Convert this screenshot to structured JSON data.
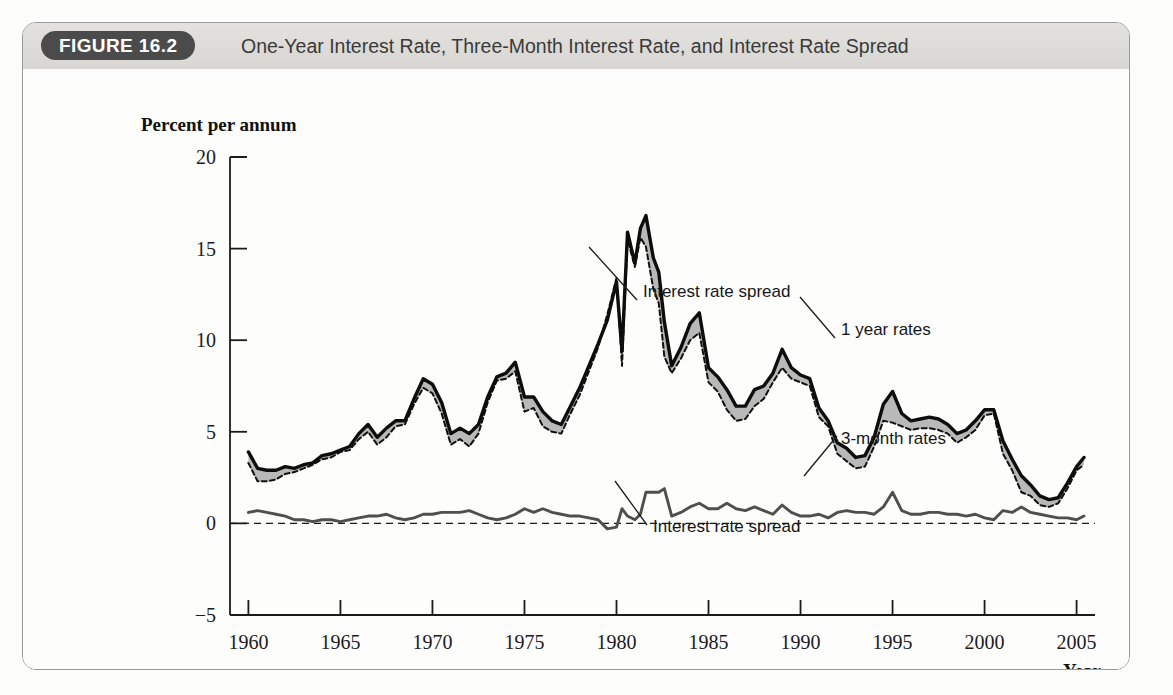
{
  "figure": {
    "badge": "FIGURE 16.2",
    "title": "One-Year Interest Rate, Three-Month Interest Rate, and Interest Rate Spread"
  },
  "chart_data": {
    "type": "line",
    "title": "One-Year Interest Rate, Three-Month Interest Rate, and Interest Rate Spread",
    "xlabel": "Year",
    "ylabel": "Percent per annum",
    "xlim": [
      1959,
      2006
    ],
    "ylim": [
      -5,
      20
    ],
    "yticks": [
      20,
      15,
      10,
      5,
      0,
      -5
    ],
    "xticks": [
      1960,
      1965,
      1970,
      1975,
      1980,
      1985,
      1990,
      1995,
      2000,
      2005
    ],
    "grid": false,
    "legend_position": "inline-annotations",
    "annotations": [
      {
        "text": "Interest rate spread",
        "target": "shaded band between 1-year and 3-month rates",
        "x": 1983.0,
        "y": 12.0
      },
      {
        "text": "1 year rates",
        "target": "solid upper line",
        "x": 1996.5,
        "y": 10.3
      },
      {
        "text": "3-month rates",
        "target": "dashed lower line",
        "x": 1996.8,
        "y": 3.3
      },
      {
        "text": "Interest rate spread",
        "target": "lower solid spread line",
        "x": 1981.5,
        "y": -1.2
      }
    ],
    "series": [
      {
        "name": "1 year rates",
        "style": "solid-thick-black",
        "x": [
          1960.0,
          1960.5,
          1961.0,
          1961.5,
          1962.0,
          1962.5,
          1963.0,
          1963.5,
          1964.0,
          1964.5,
          1965.0,
          1965.5,
          1966.0,
          1966.5,
          1967.0,
          1967.5,
          1968.0,
          1968.5,
          1969.0,
          1969.5,
          1970.0,
          1970.5,
          1971.0,
          1971.5,
          1972.0,
          1972.5,
          1973.0,
          1973.5,
          1974.0,
          1974.5,
          1975.0,
          1975.5,
          1976.0,
          1976.5,
          1977.0,
          1977.5,
          1978.0,
          1978.5,
          1979.0,
          1979.5,
          1980.0,
          1980.3,
          1980.6,
          1981.0,
          1981.3,
          1981.6,
          1982.0,
          1982.3,
          1982.6,
          1983.0,
          1983.5,
          1984.0,
          1984.5,
          1985.0,
          1985.5,
          1986.0,
          1986.5,
          1987.0,
          1987.5,
          1988.0,
          1988.5,
          1989.0,
          1989.5,
          1990.0,
          1990.5,
          1991.0,
          1991.5,
          1992.0,
          1992.5,
          1993.0,
          1993.5,
          1994.0,
          1994.5,
          1995.0,
          1995.5,
          1996.0,
          1996.5,
          1997.0,
          1997.5,
          1998.0,
          1998.5,
          1999.0,
          1999.5,
          2000.0,
          2000.5,
          2001.0,
          2001.5,
          2002.0,
          2002.5,
          2003.0,
          2003.5,
          2004.0,
          2004.5,
          2005.0,
          2005.4
        ],
        "y": [
          3.9,
          3.0,
          2.9,
          2.9,
          3.1,
          3.0,
          3.2,
          3.3,
          3.7,
          3.8,
          4.0,
          4.2,
          4.9,
          5.4,
          4.7,
          5.2,
          5.6,
          5.6,
          6.8,
          7.9,
          7.6,
          6.6,
          4.9,
          5.2,
          4.9,
          5.4,
          6.9,
          8.0,
          8.2,
          8.8,
          6.9,
          6.9,
          6.1,
          5.6,
          5.4,
          6.4,
          7.4,
          8.6,
          9.8,
          11.1,
          13.2,
          9.4,
          15.9,
          14.2,
          16.1,
          16.8,
          14.5,
          13.7,
          11.0,
          8.6,
          9.6,
          10.9,
          11.5,
          8.5,
          8.0,
          7.3,
          6.4,
          6.4,
          7.3,
          7.5,
          8.2,
          9.5,
          8.5,
          8.1,
          7.9,
          6.3,
          5.6,
          4.4,
          4.1,
          3.6,
          3.7,
          4.7,
          6.5,
          7.2,
          6.0,
          5.6,
          5.7,
          5.8,
          5.7,
          5.4,
          4.9,
          5.1,
          5.6,
          6.2,
          6.2,
          4.5,
          3.5,
          2.6,
          2.1,
          1.5,
          1.3,
          1.4,
          2.2,
          3.1,
          3.6
        ]
      },
      {
        "name": "3-month rates",
        "style": "dashed-black",
        "x": [
          1960.0,
          1960.5,
          1961.0,
          1961.5,
          1962.0,
          1962.5,
          1963.0,
          1963.5,
          1964.0,
          1964.5,
          1965.0,
          1965.5,
          1966.0,
          1966.5,
          1967.0,
          1967.5,
          1968.0,
          1968.5,
          1969.0,
          1969.5,
          1970.0,
          1970.5,
          1971.0,
          1971.5,
          1972.0,
          1972.5,
          1973.0,
          1973.5,
          1974.0,
          1974.5,
          1975.0,
          1975.5,
          1976.0,
          1976.5,
          1977.0,
          1977.5,
          1978.0,
          1978.5,
          1979.0,
          1979.5,
          1980.0,
          1980.3,
          1980.6,
          1981.0,
          1981.3,
          1981.6,
          1982.0,
          1982.3,
          1982.6,
          1983.0,
          1983.5,
          1984.0,
          1984.5,
          1985.0,
          1985.5,
          1986.0,
          1986.5,
          1987.0,
          1987.5,
          1988.0,
          1988.5,
          1989.0,
          1989.5,
          1990.0,
          1990.5,
          1991.0,
          1991.5,
          1992.0,
          1992.5,
          1993.0,
          1993.5,
          1994.0,
          1994.5,
          1995.0,
          1995.5,
          1996.0,
          1996.5,
          1997.0,
          1997.5,
          1998.0,
          1998.5,
          1999.0,
          1999.5,
          2000.0,
          2000.5,
          2001.0,
          2001.5,
          2002.0,
          2002.5,
          2003.0,
          2003.5,
          2004.0,
          2004.5,
          2005.0,
          2005.4
        ],
        "y": [
          3.3,
          2.3,
          2.3,
          2.4,
          2.7,
          2.8,
          3.0,
          3.2,
          3.5,
          3.6,
          3.9,
          4.0,
          4.6,
          5.0,
          4.3,
          4.7,
          5.3,
          5.4,
          6.5,
          7.4,
          7.1,
          6.0,
          4.3,
          4.6,
          4.2,
          4.9,
          6.6,
          7.8,
          7.9,
          8.3,
          6.1,
          6.3,
          5.3,
          5.0,
          4.9,
          6.0,
          7.0,
          8.3,
          9.6,
          11.4,
          13.4,
          8.6,
          15.5,
          14.0,
          15.6,
          15.1,
          12.8,
          12.0,
          9.1,
          8.2,
          9.0,
          10.0,
          10.4,
          7.7,
          7.2,
          6.2,
          5.6,
          5.7,
          6.4,
          6.8,
          7.7,
          8.5,
          7.9,
          7.7,
          7.5,
          5.8,
          5.3,
          3.8,
          3.4,
          3.0,
          3.1,
          4.2,
          5.6,
          5.5,
          5.3,
          5.1,
          5.2,
          5.2,
          5.1,
          4.9,
          4.4,
          4.7,
          5.1,
          5.9,
          6.0,
          3.8,
          2.9,
          1.7,
          1.5,
          1.0,
          0.9,
          1.1,
          1.9,
          2.9,
          3.2
        ]
      },
      {
        "name": "Interest rate spread",
        "style": "solid-medium-gray",
        "x": [
          1960.0,
          1960.5,
          1961.0,
          1961.5,
          1962.0,
          1962.5,
          1963.0,
          1963.5,
          1964.0,
          1964.5,
          1965.0,
          1965.5,
          1966.0,
          1966.5,
          1967.0,
          1967.5,
          1968.0,
          1968.5,
          1969.0,
          1969.5,
          1970.0,
          1970.5,
          1971.0,
          1971.5,
          1972.0,
          1972.5,
          1973.0,
          1973.5,
          1974.0,
          1974.5,
          1975.0,
          1975.5,
          1976.0,
          1976.5,
          1977.0,
          1977.5,
          1978.0,
          1978.5,
          1979.0,
          1979.5,
          1980.0,
          1980.3,
          1980.6,
          1981.0,
          1981.3,
          1981.6,
          1982.0,
          1982.3,
          1982.6,
          1983.0,
          1983.5,
          1984.0,
          1984.5,
          1985.0,
          1985.5,
          1986.0,
          1986.5,
          1987.0,
          1987.5,
          1988.0,
          1988.5,
          1989.0,
          1989.5,
          1990.0,
          1990.5,
          1991.0,
          1991.5,
          1992.0,
          1992.5,
          1993.0,
          1993.5,
          1994.0,
          1994.5,
          1995.0,
          1995.5,
          1996.0,
          1996.5,
          1997.0,
          1997.5,
          1998.0,
          1998.5,
          1999.0,
          1999.5,
          2000.0,
          2000.5,
          2001.0,
          2001.5,
          2002.0,
          2002.5,
          2003.0,
          2003.5,
          2004.0,
          2004.5,
          2005.0,
          2005.4
        ],
        "y": [
          0.6,
          0.7,
          0.6,
          0.5,
          0.4,
          0.2,
          0.2,
          0.1,
          0.2,
          0.2,
          0.1,
          0.2,
          0.3,
          0.4,
          0.4,
          0.5,
          0.3,
          0.2,
          0.3,
          0.5,
          0.5,
          0.6,
          0.6,
          0.6,
          0.7,
          0.5,
          0.3,
          0.2,
          0.3,
          0.5,
          0.8,
          0.6,
          0.8,
          0.6,
          0.5,
          0.4,
          0.4,
          0.3,
          0.2,
          -0.3,
          -0.2,
          0.8,
          0.4,
          0.2,
          0.5,
          1.7,
          1.7,
          1.7,
          1.9,
          0.4,
          0.6,
          0.9,
          1.1,
          0.8,
          0.8,
          1.1,
          0.8,
          0.7,
          0.9,
          0.7,
          0.5,
          1.0,
          0.6,
          0.4,
          0.4,
          0.5,
          0.3,
          0.6,
          0.7,
          0.6,
          0.6,
          0.5,
          0.9,
          1.7,
          0.7,
          0.5,
          0.5,
          0.6,
          0.6,
          0.5,
          0.5,
          0.4,
          0.5,
          0.3,
          0.2,
          0.7,
          0.6,
          0.9,
          0.6,
          0.5,
          0.4,
          0.3,
          0.3,
          0.2,
          0.4
        ]
      }
    ]
  },
  "axes": {
    "y_header": "Percent per annum",
    "y_ticks": [
      "20",
      "15",
      "10",
      "5",
      "0",
      "-5"
    ],
    "x_ticks": [
      "1960",
      "1965",
      "1970",
      "1975",
      "1980",
      "1985",
      "1990",
      "1995",
      "2000",
      "2005"
    ],
    "x_name": "Year"
  },
  "annotations": {
    "spread_upper": "Interest rate spread",
    "one_year": "1 year rates",
    "three_month": "3-month rates",
    "spread_lower": "Interest rate spread"
  }
}
